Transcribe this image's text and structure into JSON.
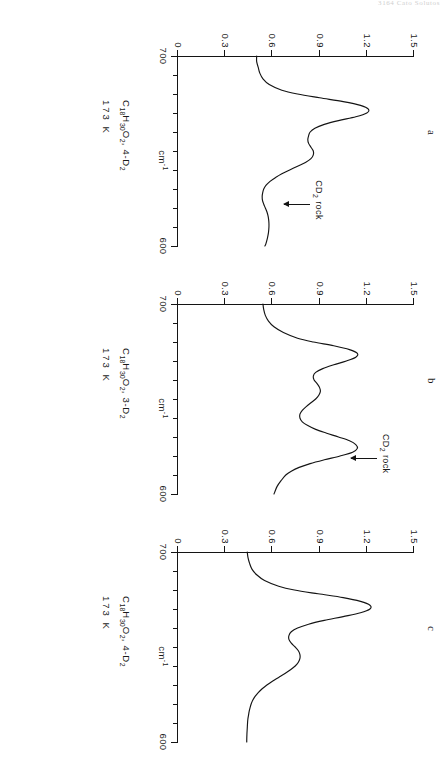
{
  "running_head": "3164  Cato Solutos",
  "figure": {
    "axis": {
      "y_title": "",
      "y_ticks": [
        "1.5",
        "1.2",
        "0.9",
        "0.6",
        "0.3",
        "0"
      ],
      "y_values": [
        1.5,
        1.2,
        0.9,
        0.6,
        0.3,
        0.0
      ],
      "x_title": "cm",
      "x_title_sup": "-1",
      "x_ticks": [
        "700",
        "600"
      ],
      "x_values": [
        700,
        600
      ]
    },
    "panels": [
      {
        "letter": "a",
        "caption_line1_pre": "C",
        "caption_line1_sub1": "18",
        "caption_line1_mid": "H",
        "caption_line1_sub2": "30",
        "caption_line1_mid2": "O",
        "caption_line1_sub3": "2",
        "caption_line1_post": ", 4-D",
        "caption_line1_sub4": "2",
        "caption_line2": "173 K",
        "annotation_pre": "CD",
        "annotation_sub": "2",
        "annotation_post": " rock"
      },
      {
        "letter": "b",
        "caption_line1_pre": "C",
        "caption_line1_sub1": "18",
        "caption_line1_mid": "H",
        "caption_line1_sub2": "30",
        "caption_line1_mid2": "O",
        "caption_line1_sub3": "2",
        "caption_line1_post": ", 3-D",
        "caption_line1_sub4": "2",
        "caption_line2": "173 K",
        "annotation_pre": "CD",
        "annotation_sub": "2",
        "annotation_post": " rock"
      },
      {
        "letter": "c",
        "caption_line1_pre": "C",
        "caption_line1_sub1": "18",
        "caption_line1_mid": "H",
        "caption_line1_sub2": "30",
        "caption_line1_mid2": "O",
        "caption_line1_sub3": "2",
        "caption_line1_post": ", 4-D",
        "caption_line1_sub4": "2",
        "caption_line2": "173 K",
        "annotation_pre": "",
        "annotation_sub": "",
        "annotation_post": ""
      }
    ]
  },
  "chart_data": {
    "type": "line",
    "xlabel": "cm-1",
    "ylabel": "Absorbance",
    "xlim": [
      700,
      600
    ],
    "ylim": [
      0,
      1.5
    ],
    "x_ticks": [
      700,
      690,
      680,
      670,
      660,
      650,
      640,
      630,
      620,
      610,
      600
    ],
    "x_major_ticks": [
      700,
      600
    ],
    "y_ticks": [
      0,
      0.3,
      0.6,
      0.9,
      1.2,
      1.5
    ],
    "grid": false,
    "legend": "none",
    "note": "x axis runs right-to-left in wavenumbers (700 at left end of axis, 600 at right end). Absorbance on y axis 0 to 1.5.",
    "panels": [
      {
        "label": "a",
        "sample": "C18H30O2, 4-D2",
        "temperature": "173 K",
        "annotation": "CD2 rock",
        "annotation_x": 622,
        "annotation_y": 0.62,
        "series": [
          {
            "name": "absorbance",
            "x": [
              700,
              697,
              694,
              691,
              688,
              685,
              682,
              680,
              678,
              676,
              674,
              672,
              670,
              668,
              666,
              664,
              662,
              660,
              658,
              656,
              654,
              652,
              650,
              648,
              646,
              644,
              642,
              640,
              638,
              636,
              634,
              632,
              630,
              628,
              626,
              624,
              622,
              620,
              618,
              616,
              614,
              612,
              610,
              607,
              604,
              601,
              600
            ],
            "y": [
              0.5,
              0.5,
              0.51,
              0.52,
              0.54,
              0.58,
              0.66,
              0.76,
              0.9,
              1.05,
              1.16,
              1.21,
              1.2,
              1.13,
              1.02,
              0.93,
              0.87,
              0.84,
              0.83,
              0.825,
              0.83,
              0.845,
              0.86,
              0.86,
              0.845,
              0.81,
              0.76,
              0.71,
              0.66,
              0.62,
              0.585,
              0.56,
              0.545,
              0.538,
              0.535,
              0.537,
              0.545,
              0.555,
              0.565,
              0.572,
              0.576,
              0.578,
              0.578,
              0.575,
              0.568,
              0.558,
              0.552
            ]
          }
        ]
      },
      {
        "label": "b",
        "sample": "C18H30O2, 3-D2",
        "temperature": "173 K",
        "annotation": "CD2 rock",
        "annotation_x": 619,
        "annotation_y": 1.05,
        "series": [
          {
            "name": "absorbance",
            "x": [
              700,
              697,
              694,
              691,
              688,
              685,
              682,
              680,
              678,
              676,
              674,
              672,
              670,
              668,
              666,
              664,
              662,
              660,
              658,
              656,
              654,
              652,
              650,
              648,
              646,
              644,
              642,
              640,
              638,
              636,
              634,
              632,
              630,
              628,
              626,
              624,
              622,
              620,
              618,
              616,
              614,
              612,
              610,
              607,
              604,
              601,
              600
            ],
            "y": [
              0.54,
              0.545,
              0.555,
              0.575,
              0.61,
              0.67,
              0.76,
              0.86,
              0.99,
              1.09,
              1.14,
              1.13,
              1.07,
              0.99,
              0.92,
              0.875,
              0.86,
              0.865,
              0.885,
              0.9,
              0.905,
              0.895,
              0.875,
              0.845,
              0.815,
              0.79,
              0.775,
              0.775,
              0.79,
              0.825,
              0.875,
              0.945,
              1.02,
              1.09,
              1.13,
              1.14,
              1.11,
              1.03,
              0.93,
              0.84,
              0.77,
              0.72,
              0.685,
              0.655,
              0.63,
              0.615,
              0.61
            ]
          }
        ]
      },
      {
        "label": "c",
        "sample": "C18H30O2, 4-D2",
        "temperature": "173 K",
        "annotation": "",
        "series": [
          {
            "name": "absorbance",
            "x": [
              700,
              697,
              694,
              691,
              688,
              685,
              682,
              680,
              678,
              676,
              674,
              672,
              670,
              668,
              666,
              664,
              662,
              660,
              658,
              656,
              654,
              652,
              650,
              648,
              646,
              644,
              642,
              640,
              638,
              636,
              634,
              632,
              630,
              628,
              626,
              624,
              622,
              620,
              618,
              616,
              614,
              612,
              610,
              607,
              604,
              601,
              600
            ],
            "y": [
              0.44,
              0.445,
              0.455,
              0.47,
              0.5,
              0.55,
              0.64,
              0.74,
              0.89,
              1.05,
              1.16,
              1.22,
              1.22,
              1.16,
              1.05,
              0.93,
              0.83,
              0.76,
              0.72,
              0.705,
              0.705,
              0.72,
              0.745,
              0.765,
              0.775,
              0.775,
              0.765,
              0.745,
              0.715,
              0.68,
              0.64,
              0.6,
              0.565,
              0.535,
              0.51,
              0.49,
              0.475,
              0.465,
              0.458,
              0.452,
              0.448,
              0.444,
              0.442,
              0.44,
              0.438,
              0.437,
              0.437
            ]
          }
        ]
      }
    ]
  }
}
